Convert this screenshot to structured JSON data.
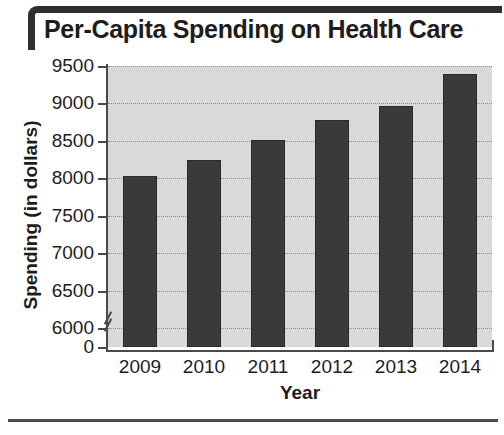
{
  "chart_data": {
    "type": "bar",
    "title": "Per-Capita Spending on Health Care",
    "xlabel": "Year",
    "ylabel": "Spending (in dollars)",
    "categories": [
      "2009",
      "2010",
      "2011",
      "2012",
      "2013",
      "2014"
    ],
    "values": [
      8030,
      8250,
      8510,
      8780,
      8970,
      9400
    ],
    "ytick_labels": [
      "9500",
      "9000",
      "8500",
      "8000",
      "7500",
      "7000",
      "6500",
      "6000",
      "0"
    ],
    "ytick_values": [
      9500,
      9000,
      8500,
      8000,
      7500,
      7000,
      6500,
      6000,
      0
    ],
    "ylim": [
      5750,
      9500
    ],
    "axis_break": true,
    "axis_break_label": "y-axis break between 0 and 6000",
    "grid": true,
    "legend": "none",
    "bar_color": "#3a3a3a",
    "plot_background": "#d9d9d9",
    "text_color": "#1d1d1d"
  }
}
